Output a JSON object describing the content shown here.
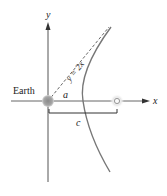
{
  "diagram": {
    "type": "hyperbola-orbit",
    "labels": {
      "y_axis": "y",
      "x_axis": "x",
      "earth": "Earth",
      "asymptote": "y = 2x",
      "semi_axis": "a",
      "focal_distance": "c"
    },
    "colors": {
      "axis": "#555555",
      "curve": "#777777",
      "dashed": "#555555",
      "earth_fill": "#9a9a9a",
      "focus": "#999999",
      "text": "#222222"
    }
  }
}
